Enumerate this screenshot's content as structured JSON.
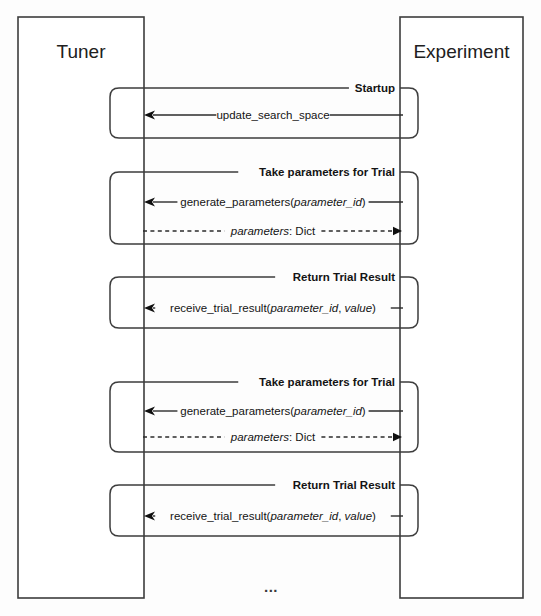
{
  "diagram": {
    "type": "sequence-diagram",
    "title": "",
    "background_color": "#fdfdfd",
    "line_color": "#3d3d3d",
    "text_color": "#141414",
    "participants": [
      {
        "id": "tuner",
        "label": "Tuner",
        "box": {
          "x": 18,
          "y": 17,
          "width": 126,
          "height": 581
        },
        "lifeline_x": 143
      },
      {
        "id": "experiment",
        "label": "Experiment",
        "box": {
          "x": 400,
          "y": 17,
          "width": 123,
          "height": 581
        },
        "lifeline_x": 403
      }
    ],
    "fragments": [
      {
        "label": "Startup",
        "x": 110,
        "y": 88,
        "width": 308,
        "height": 50,
        "messages": [
          {
            "text": "update_search_space",
            "parts": [
              {
                "t": "update_search_space",
                "italic": false
              }
            ],
            "from": "experiment",
            "to": "tuner",
            "direction": "left",
            "style": "solid",
            "arrowhead": "open",
            "y": 115
          }
        ]
      },
      {
        "label": "Take parameters for Trial",
        "x": 110,
        "y": 172,
        "width": 308,
        "height": 72,
        "messages": [
          {
            "text": "generate_parameters(parameter_id)",
            "parts": [
              {
                "t": "generate_parameters(",
                "italic": false
              },
              {
                "t": "parameter_id",
                "italic": true
              },
              {
                "t": ")",
                "italic": false
              }
            ],
            "from": "experiment",
            "to": "tuner",
            "direction": "left",
            "style": "solid",
            "arrowhead": "open",
            "y": 202
          },
          {
            "text": "parameters: Dict",
            "parts": [
              {
                "t": "parameters",
                "italic": true
              },
              {
                "t": ": Dict",
                "italic": false
              }
            ],
            "from": "tuner",
            "to": "experiment",
            "direction": "right",
            "style": "dashed",
            "arrowhead": "filled",
            "y": 231
          }
        ]
      },
      {
        "label": "Return Trial Result",
        "x": 110,
        "y": 277,
        "width": 308,
        "height": 51,
        "messages": [
          {
            "text": "receive_trial_result(parameter_id, value)",
            "parts": [
              {
                "t": "receive_trial_result(",
                "italic": false
              },
              {
                "t": "parameter_id",
                "italic": true
              },
              {
                "t": ", ",
                "italic": false
              },
              {
                "t": "value",
                "italic": true
              },
              {
                "t": ")",
                "italic": false
              }
            ],
            "from": "experiment",
            "to": "tuner",
            "direction": "left",
            "style": "solid",
            "arrowhead": "open",
            "y": 308
          }
        ]
      },
      {
        "label": "Take parameters for Trial",
        "x": 110,
        "y": 382,
        "width": 308,
        "height": 70,
        "messages": [
          {
            "text": "generate_parameters(parameter_id)",
            "parts": [
              {
                "t": "generate_parameters(",
                "italic": false
              },
              {
                "t": "parameter_id",
                "italic": true
              },
              {
                "t": ")",
                "italic": false
              }
            ],
            "from": "experiment",
            "to": "tuner",
            "direction": "left",
            "style": "solid",
            "arrowhead": "open",
            "y": 411
          },
          {
            "text": "parameters: Dict",
            "parts": [
              {
                "t": "parameters",
                "italic": true
              },
              {
                "t": ": Dict",
                "italic": false
              }
            ],
            "from": "tuner",
            "to": "experiment",
            "direction": "right",
            "style": "dashed",
            "arrowhead": "filled",
            "y": 437
          }
        ]
      },
      {
        "label": "Return Trial Result",
        "x": 110,
        "y": 485,
        "width": 308,
        "height": 51,
        "messages": [
          {
            "text": "receive_trial_result(parameter_id, value)",
            "parts": [
              {
                "t": "receive_trial_result(",
                "italic": false
              },
              {
                "t": "parameter_id",
                "italic": true
              },
              {
                "t": ", ",
                "italic": false
              },
              {
                "t": "value",
                "italic": true
              },
              {
                "t": ")",
                "italic": false
              }
            ],
            "from": "experiment",
            "to": "tuner",
            "direction": "left",
            "style": "solid",
            "arrowhead": "open",
            "y": 516
          }
        ]
      }
    ],
    "continuation": {
      "label": "...",
      "x": 271,
      "y": 588
    }
  }
}
